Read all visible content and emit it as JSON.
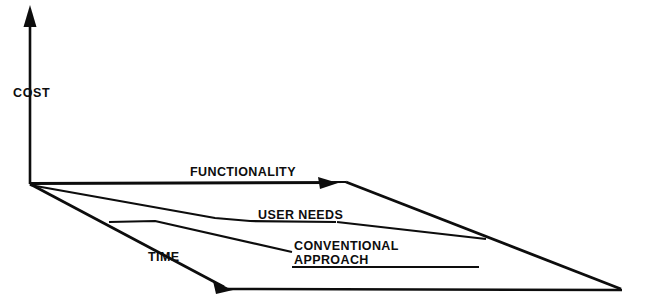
{
  "diagram": {
    "background_color": "#ffffff",
    "stroke_color": "#0d0d0d",
    "axes": {
      "vertical": {
        "label": "COST",
        "icon": "up-arrow-icon"
      },
      "depth": {
        "label": "TIME",
        "icon": "down-right-arrow-icon"
      },
      "horizontal": {
        "label": "FUNCTIONALITY",
        "icon": "right-arrow-icon"
      }
    },
    "curves": [
      {
        "label": "USER NEEDS",
        "name": "user-needs-curve"
      },
      {
        "label_line1": "CONVENTIONAL",
        "label_line2": "APPROACH",
        "name": "conventional-approach-curve"
      }
    ],
    "labels": {
      "cost": "COST",
      "functionality": "FUNCTIONALITY",
      "user_needs": "USER NEEDS",
      "conventional": "CONVENTIONAL",
      "approach": "APPROACH",
      "time": "TIME"
    }
  }
}
